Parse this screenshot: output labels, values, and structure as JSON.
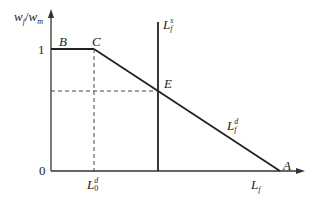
{
  "diagram": {
    "y_axis_label": {
      "main1": "w",
      "sub1": "f",
      "slash": "/",
      "main2": "w",
      "sub2": "m"
    },
    "x_axis_label": {
      "main": "L",
      "sub": "f"
    },
    "tick_labels": {
      "y_one": "1",
      "origin": "0"
    },
    "points": {
      "A": "A",
      "B": "B",
      "C": "C",
      "E": "E"
    },
    "curves": {
      "supply": {
        "main": "L",
        "sub": "f",
        "sup": "s"
      },
      "demand": {
        "main": "L",
        "sub": "f",
        "sup": "d"
      }
    },
    "x_marker": {
      "main": "L",
      "sub": "0",
      "sup": "d"
    },
    "colors": {
      "line": "#222222",
      "dashed": "#444444"
    }
  }
}
